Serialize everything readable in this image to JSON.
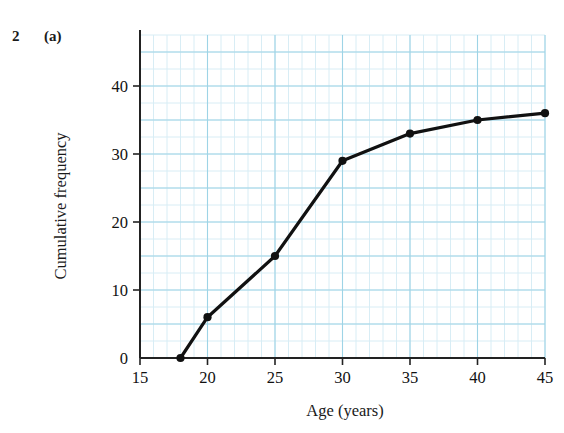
{
  "question": {
    "number": "2",
    "part": "(a)"
  },
  "chart_data": {
    "type": "line",
    "title": "",
    "subtitle": "",
    "xlabel": "Age (years)",
    "ylabel": "Cumulative frequency",
    "x": [
      18,
      20,
      25,
      30,
      35,
      40,
      45
    ],
    "values": [
      0,
      6,
      15,
      29,
      33,
      35,
      36
    ],
    "series": [
      {
        "name": "Cumulative frequency",
        "x": [
          18,
          20,
          25,
          30,
          35,
          40,
          45
        ],
        "values": [
          0,
          6,
          15,
          29,
          33,
          35,
          36
        ]
      }
    ],
    "xlim": [
      15,
      45
    ],
    "ylim": [
      0,
      47.5
    ],
    "xticks": [
      15,
      20,
      25,
      30,
      35,
      40,
      45
    ],
    "xtick_labels": [
      "15",
      "20",
      "25",
      "30",
      "35",
      "40",
      "45"
    ],
    "yticks": [
      0,
      10,
      20,
      30,
      40
    ],
    "ytick_labels": [
      "0",
      "10",
      "20",
      "30",
      "40"
    ],
    "x_minor_step": 1,
    "y_minor_step": 2.5,
    "x_major_step": 5,
    "y_major_step": 5,
    "grid": true,
    "grid_color_minor": "#d8edf5",
    "grid_color_major": "#9ed4e6",
    "line_color": "#111111",
    "marker": "circle",
    "marker_color": "#111111",
    "legend": "none",
    "annotations": []
  }
}
